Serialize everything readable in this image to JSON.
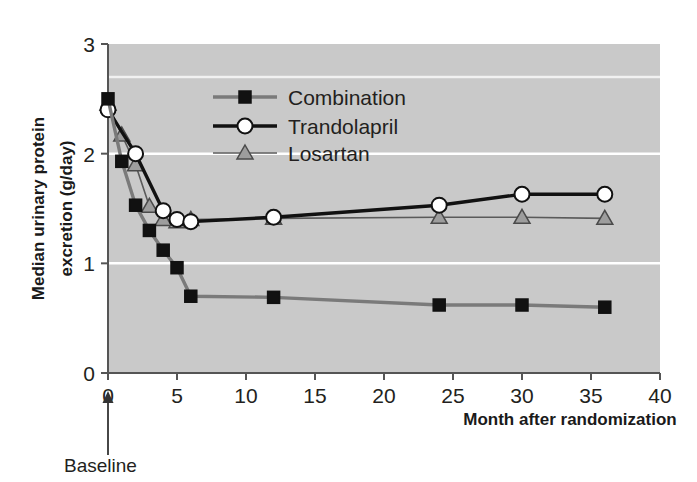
{
  "chart_data": {
    "type": "line",
    "title": "",
    "xlabel": "Month after randomization",
    "ylabel": "Median urinary protein excretion (g/day)",
    "xlim": [
      0,
      40
    ],
    "ylim": [
      0,
      3
    ],
    "xticks": [
      "0",
      "5",
      "10",
      "15",
      "20",
      "25",
      "30",
      "35",
      "40"
    ],
    "xtick_values": [
      0,
      5,
      10,
      15,
      20,
      25,
      30,
      35,
      40
    ],
    "yticks": [
      "0",
      "1",
      "2",
      "3"
    ],
    "ytick_values": [
      0,
      1,
      2,
      3
    ],
    "grid": "horizontal white gridlines at y = 1, 2, 2.7",
    "gridlines": [
      1,
      2,
      2.7
    ],
    "plot_background": "#c9c9c9",
    "legend_position": "upper-center-right inside plot",
    "annotations": [
      {
        "name": "baseline-annotation",
        "text": "Baseline",
        "points_to_x": 0,
        "arrow": "up"
      }
    ],
    "series": [
      {
        "name": "Combination",
        "color": "#7a7a7a",
        "marker": "square",
        "marker_color": "#111111",
        "x": [
          0,
          1,
          2,
          3,
          4,
          5,
          6,
          12,
          24,
          30,
          36
        ],
        "y": [
          2.5,
          1.93,
          1.53,
          1.3,
          1.12,
          0.96,
          0.7,
          0.69,
          0.62,
          0.62,
          0.6
        ]
      },
      {
        "name": "Trandolapril",
        "color": "#111111",
        "marker": "circle",
        "marker_color": "#ffffff",
        "x": [
          0,
          2,
          4,
          5,
          6,
          12,
          24,
          30,
          36
        ],
        "y": [
          2.4,
          2.0,
          1.48,
          1.4,
          1.38,
          1.42,
          1.53,
          1.63,
          1.63
        ]
      },
      {
        "name": "Losartan",
        "color": "#5a5a5a",
        "marker": "triangle",
        "marker_color": "#9d9d9d",
        "x": [
          0,
          1,
          2,
          3,
          4,
          5,
          6,
          12,
          24,
          30,
          36
        ],
        "y": [
          2.45,
          2.17,
          1.9,
          1.52,
          1.4,
          1.38,
          1.4,
          1.41,
          1.42,
          1.42,
          1.41
        ]
      }
    ]
  },
  "legend": {
    "items": [
      {
        "label": "Combination",
        "marker": "square"
      },
      {
        "label": "Trandolapril",
        "marker": "circle"
      },
      {
        "label": "Losartan",
        "marker": "triangle"
      }
    ]
  },
  "axis": {
    "x_label": "Month after randomization",
    "y_label_line1": "Median urinary protein",
    "y_label_line2": "excretion (g/day)"
  },
  "baseline": {
    "label": "Baseline"
  }
}
